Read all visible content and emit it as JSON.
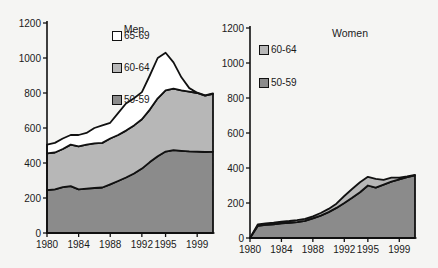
{
  "page": {
    "background": "#f5f5f3"
  },
  "chart_data": [
    {
      "type": "area",
      "stacked": true,
      "title": "Men",
      "x": [
        1980,
        1981,
        1982,
        1983,
        1984,
        1985,
        1986,
        1987,
        1988,
        1989,
        1990,
        1991,
        1992,
        1993,
        1994,
        1995,
        1996,
        1997,
        1998,
        1999,
        2000,
        2001
      ],
      "x_tick_labels": [
        "1980",
        "1984",
        "1988",
        "1992",
        "1995",
        "1999"
      ],
      "x_tick_years": [
        1980,
        1984,
        1988,
        1992,
        1995,
        1999
      ],
      "ylim": [
        0,
        1200
      ],
      "y_ticks": [
        0,
        200,
        400,
        600,
        800,
        1000,
        1200
      ],
      "grid": false,
      "legend_order": [
        "65-69",
        "60-64",
        "50-59"
      ],
      "series": [
        {
          "name": "50-59",
          "color": "#8b8b8b",
          "values": [
            245,
            250,
            262,
            268,
            250,
            253,
            257,
            260,
            278,
            297,
            317,
            340,
            368,
            405,
            438,
            465,
            473,
            470,
            467,
            465,
            463,
            465
          ]
        },
        {
          "name": "60-64",
          "color": "#b7b7b7",
          "values": [
            210,
            210,
            218,
            237,
            245,
            252,
            255,
            255,
            262,
            263,
            268,
            275,
            282,
            300,
            332,
            350,
            352,
            345,
            341,
            335,
            322,
            330
          ]
        },
        {
          "name": "65-69",
          "color": "#ffffff",
          "values": [
            50,
            55,
            60,
            55,
            65,
            67,
            88,
            100,
            90,
            125,
            155,
            155,
            155,
            195,
            230,
            215,
            150,
            75,
            20,
            2,
            2,
            2
          ]
        }
      ]
    },
    {
      "type": "area",
      "stacked": true,
      "title": "Women",
      "x": [
        1980,
        1981,
        1982,
        1983,
        1984,
        1985,
        1986,
        1987,
        1988,
        1989,
        1990,
        1991,
        1992,
        1993,
        1994,
        1995,
        1996,
        1997,
        1998,
        1999,
        2000,
        2001
      ],
      "x_tick_labels": [
        "1980",
        "1984",
        "1988",
        "1992",
        "1995",
        "1999"
      ],
      "x_tick_years": [
        1980,
        1984,
        1988,
        1992,
        1995,
        1999
      ],
      "ylim": [
        0,
        1200
      ],
      "y_ticks": [
        0,
        200,
        400,
        600,
        800,
        1000,
        1200
      ],
      "grid": false,
      "legend_order": [
        "60-64",
        "50-59"
      ],
      "series": [
        {
          "name": "50-59",
          "color": "#8b8b8b",
          "values": [
            0,
            70,
            75,
            78,
            84,
            87,
            91,
            98,
            112,
            128,
            148,
            172,
            200,
            230,
            262,
            300,
            288,
            305,
            322,
            335,
            348,
            358
          ]
        },
        {
          "name": "60-64",
          "color": "#b7b7b7",
          "values": [
            0,
            8,
            9,
            10,
            10,
            10,
            11,
            11,
            12,
            15,
            18,
            24,
            40,
            50,
            56,
            50,
            50,
            27,
            23,
            10,
            4,
            2
          ]
        }
      ]
    }
  ]
}
